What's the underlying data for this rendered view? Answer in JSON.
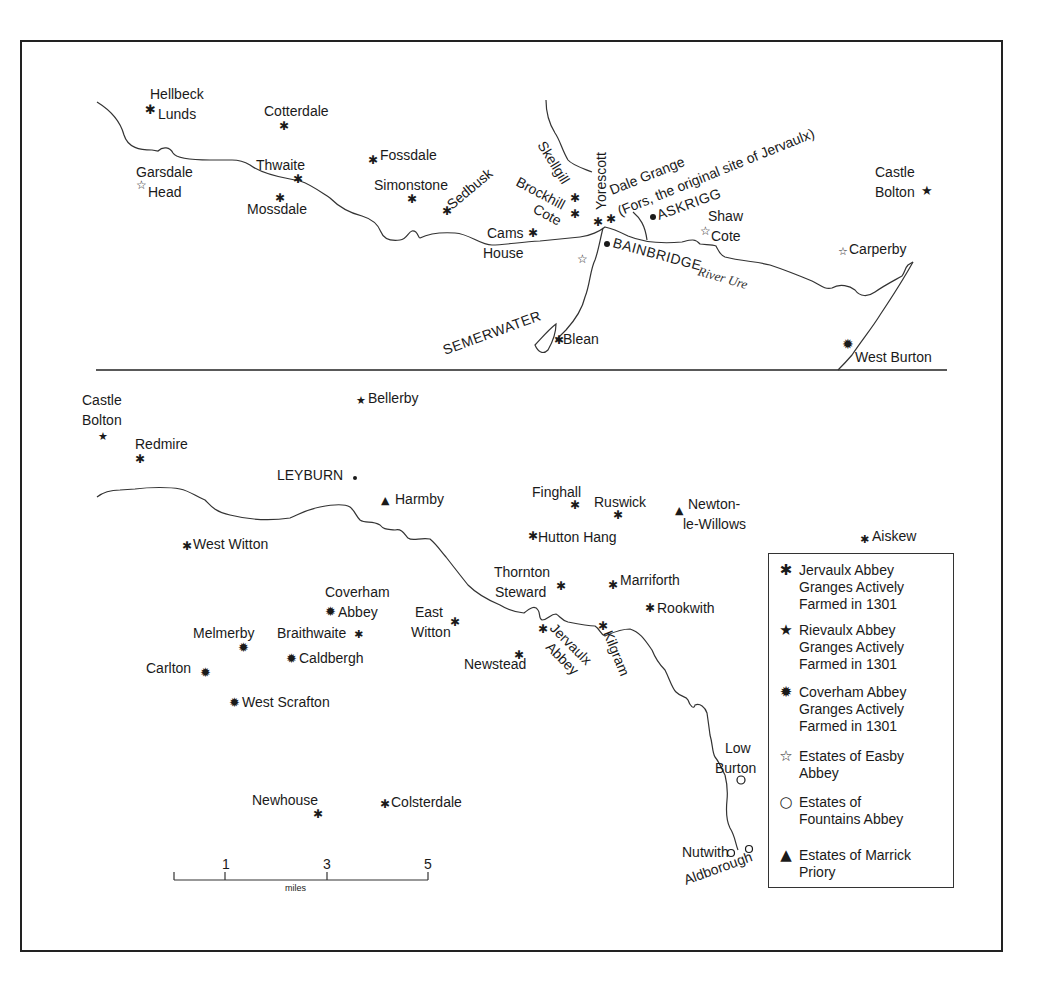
{
  "map": {
    "title": "Monastic granges and estates of Wensleydale",
    "upper_panel": {
      "river_label": "River Ure",
      "places": [
        {
          "name": "Hellbeck Lunds",
          "lines": [
            "Hellbeck",
            "Lunds"
          ],
          "symbol": "jervaulx"
        },
        {
          "name": "Cotterdale",
          "lines": [
            "Cotterdale"
          ],
          "symbol": "jervaulx"
        },
        {
          "name": "Garsdale Head",
          "lines": [
            "Garsdale",
            "Head"
          ],
          "symbol": "easby"
        },
        {
          "name": "Thwaite",
          "lines": [
            "Thwaite"
          ],
          "symbol": "jervaulx"
        },
        {
          "name": "Mossdale",
          "lines": [
            "Mossdale"
          ],
          "symbol": "jervaulx"
        },
        {
          "name": "Fossdale",
          "lines": [
            "Fossdale"
          ],
          "symbol": "jervaulx"
        },
        {
          "name": "Simonstone",
          "lines": [
            "Simonstone"
          ],
          "symbol": "jervaulx"
        },
        {
          "name": "Sedbusk",
          "lines": [
            "Sedbusk"
          ],
          "symbol": "jervaulx"
        },
        {
          "name": "Skellgill",
          "lines": [
            "Skellgill"
          ],
          "symbol": "jervaulx"
        },
        {
          "name": "Brockhill Cote",
          "lines": [
            "Brockhill",
            "Cote"
          ],
          "symbol": "jervaulx"
        },
        {
          "name": "Yorescott",
          "lines": [
            "Yorescott"
          ],
          "symbol": "jervaulx"
        },
        {
          "name": "Dale Grange",
          "lines": [
            "Dale Grange",
            "(Fors, the original site of Jervaulx)"
          ],
          "symbol": "jervaulx"
        },
        {
          "name": "Cams House",
          "lines": [
            "Cams",
            "House"
          ],
          "symbol": "jervaulx"
        },
        {
          "name": "ASKRIGG",
          "lines": [
            "ASKRIGG"
          ],
          "symbol": "town"
        },
        {
          "name": "BAINBRIDGE",
          "lines": [
            "BAINBRIDGE"
          ],
          "symbol": "town"
        },
        {
          "name": "Shaw Cote",
          "lines": [
            "Shaw",
            "Cote"
          ],
          "symbol": "easby"
        },
        {
          "name": "Castle Bolton",
          "lines": [
            "Castle",
            "Bolton"
          ],
          "symbol": "rievaulx"
        },
        {
          "name": "Carperby",
          "lines": [
            "Carperby"
          ],
          "symbol": "easby"
        },
        {
          "name": "SEMERWATER",
          "lines": [
            "SEMERWATER"
          ],
          "symbol": "lake"
        },
        {
          "name": "Blean",
          "lines": [
            "Blean"
          ],
          "symbol": "jervaulx"
        },
        {
          "name": "West Burton",
          "lines": [
            "West Burton"
          ],
          "symbol": "coverham"
        }
      ]
    },
    "lower_panel": {
      "places": [
        {
          "name": "Castle Bolton",
          "lines": [
            "Castle",
            "Bolton"
          ],
          "symbol": "rievaulx"
        },
        {
          "name": "Bellerby",
          "lines": [
            "Bellerby"
          ],
          "symbol": "rievaulx"
        },
        {
          "name": "Redmire",
          "lines": [
            "Redmire"
          ],
          "symbol": "jervaulx"
        },
        {
          "name": "LEYBURN",
          "lines": [
            "LEYBURN"
          ],
          "symbol": "town"
        },
        {
          "name": "Harmby",
          "lines": [
            "Harmby"
          ],
          "symbol": "marrick"
        },
        {
          "name": "Finghall",
          "lines": [
            "Finghall"
          ],
          "symbol": "jervaulx"
        },
        {
          "name": "Ruswick",
          "lines": [
            "Ruswick"
          ],
          "symbol": "jervaulx"
        },
        {
          "name": "Newton-le-Willows",
          "lines": [
            "Newton-",
            "le-Willows"
          ],
          "symbol": "marrick"
        },
        {
          "name": "West Witton",
          "lines": [
            "West Witton"
          ],
          "symbol": "jervaulx"
        },
        {
          "name": "Hutton Hang",
          "lines": [
            "Hutton Hang"
          ],
          "symbol": "jervaulx"
        },
        {
          "name": "Aiskew",
          "lines": [
            "Aiskew"
          ],
          "symbol": "jervaulx"
        },
        {
          "name": "Thornton Steward",
          "lines": [
            "Thornton",
            "Steward"
          ],
          "symbol": "jervaulx"
        },
        {
          "name": "Marriforth",
          "lines": [
            "Marriforth"
          ],
          "symbol": "jervaulx"
        },
        {
          "name": "Coverham Abbey",
          "lines": [
            "Coverham",
            "Abbey"
          ],
          "symbol": "coverham"
        },
        {
          "name": "East Witton",
          "lines": [
            "East",
            "Witton"
          ],
          "symbol": "jervaulx"
        },
        {
          "name": "Rookwith",
          "lines": [
            "Rookwith"
          ],
          "symbol": "jervaulx"
        },
        {
          "name": "Melmerby",
          "lines": [
            "Melmerby"
          ],
          "symbol": "coverham"
        },
        {
          "name": "Braithwaite",
          "lines": [
            "Braithwaite"
          ],
          "symbol": "jervaulx"
        },
        {
          "name": "Jervaulx Abbey",
          "lines": [
            "Jervaulx",
            "Abbey"
          ],
          "symbol": "jervaulx"
        },
        {
          "name": "Kilgram",
          "lines": [
            "Kilgram"
          ],
          "symbol": "jervaulx"
        },
        {
          "name": "Caldbergh",
          "lines": [
            "Caldbergh"
          ],
          "symbol": "coverham"
        },
        {
          "name": "Newstead",
          "lines": [
            "Newstead"
          ],
          "symbol": "jervaulx"
        },
        {
          "name": "Carlton",
          "lines": [
            "Carlton"
          ],
          "symbol": "coverham"
        },
        {
          "name": "West Scrafton",
          "lines": [
            "West Scrafton"
          ],
          "symbol": "coverham"
        },
        {
          "name": "Low Burton",
          "lines": [
            "Low",
            "Burton"
          ],
          "symbol": "fountains"
        },
        {
          "name": "Newhouse",
          "lines": [
            "Newhouse"
          ],
          "symbol": "jervaulx"
        },
        {
          "name": "Colsterdale",
          "lines": [
            "Colsterdale"
          ],
          "symbol": "jervaulx"
        },
        {
          "name": "Nutwith",
          "lines": [
            "Nutwith"
          ],
          "symbol": "fountains"
        },
        {
          "name": "Aldborough",
          "lines": [
            "Aldborough"
          ],
          "symbol": "fountains"
        }
      ]
    },
    "scale_bar": {
      "ticks": [
        "1",
        "3",
        "5"
      ],
      "unit": "miles"
    },
    "symbols": {
      "jervaulx": "✱",
      "rievaulx": "★",
      "coverham": "✹",
      "easby": "☆",
      "fountains": "○",
      "marrick": "▲",
      "town": "•"
    },
    "legend": {
      "items": [
        {
          "symbol": "✱",
          "icon": "asterisk-icon",
          "label": "Jervaulx Abbey Granges Actively Farmed in 1301"
        },
        {
          "symbol": "★",
          "icon": "filled-star-icon",
          "label": "Rievaulx Abbey Granges Actively Farmed in 1301"
        },
        {
          "symbol": "✹",
          "icon": "starburst-icon",
          "label": "Coverham Abbey Granges Actively Farmed in 1301"
        },
        {
          "symbol": "☆",
          "icon": "open-star-icon",
          "label": "Estates of Easby Abbey"
        },
        {
          "symbol": "○",
          "icon": "open-circle-icon",
          "label": "Estates of Fountains Abbey"
        },
        {
          "symbol": "▲",
          "icon": "triangle-icon",
          "label": "Estates of Marrick Priory"
        }
      ]
    }
  }
}
